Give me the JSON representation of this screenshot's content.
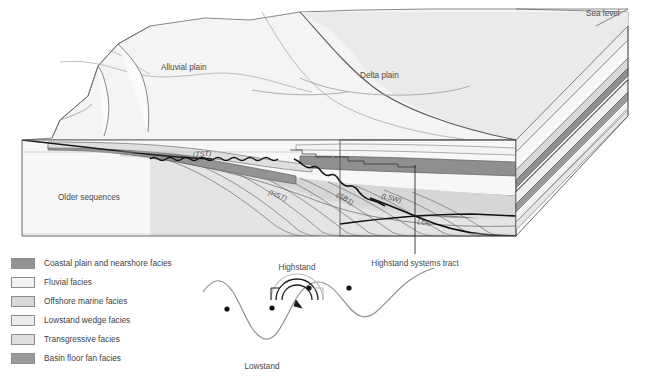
{
  "figure": {
    "type": "geological-block-diagram",
    "title_visible": false
  },
  "diagram_labels": {
    "sea_level": "Sea level",
    "alluvial_plain": "Alluvial plain",
    "delta_plain": "Delta plain",
    "older_sequences": "Older sequences",
    "tst": "(TST)",
    "hst": "(HST)",
    "sb1": "(SB1)",
    "lsw": "(LSW)",
    "lcc": "LCC"
  },
  "callout": {
    "label": "Highstand systems tract"
  },
  "legend": {
    "items": [
      {
        "label": "Coastal plain and nearshore facies",
        "color": "#939393"
      },
      {
        "label": "Fluvial facies",
        "color": "#f2f2f2"
      },
      {
        "label": "Offshore marine facies",
        "color": "#d8d8d8"
      },
      {
        "label": "Lowstand wedge facies",
        "color": "#ebebeb"
      },
      {
        "label": "Transgressive facies",
        "color": "#dedede"
      },
      {
        "label": "Basin floor fan facies",
        "color": "#9a9a9a"
      }
    ]
  },
  "sea_level_curve": {
    "type": "line",
    "highstand_label": "Highstand",
    "lowstand_label": "Lowstand",
    "description": "Sinusoidal relative sea-level curve with marked highstand peak and lowstand trough",
    "x": [
      205,
      225,
      248,
      262,
      278,
      297,
      312,
      330,
      345,
      363,
      381,
      398,
      412,
      428
    ],
    "y": [
      290,
      283,
      300,
      322,
      337,
      329,
      308,
      292,
      285,
      292,
      305,
      312,
      302,
      288
    ],
    "markers": [
      {
        "x": 227,
        "y": 309,
        "note": "point-1"
      },
      {
        "x": 272,
        "y": 308,
        "note": "point-2"
      },
      {
        "x": 309,
        "y": 288,
        "note": "point-3"
      },
      {
        "x": 349,
        "y": 288,
        "note": "point-4"
      }
    ],
    "magnifier": {
      "cx": 297,
      "cy": 300,
      "note": "arc highlight over highstand peak"
    }
  }
}
